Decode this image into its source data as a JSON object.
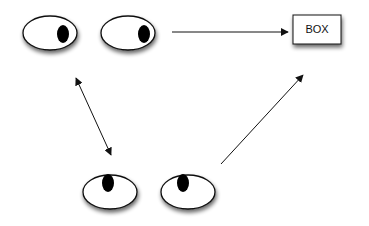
{
  "diagram": {
    "title": "",
    "colors": {
      "stroke": "#111111",
      "fill": "#ffffff",
      "pupil": "#000000",
      "shadow": "#555555"
    },
    "eyes": [
      {
        "id": "eye-top-left",
        "cx": 50,
        "cy": 33,
        "rx": 27,
        "ry": 17,
        "pupil": {
          "cx": 63,
          "cy": 34,
          "rx": 6,
          "ry": 9
        },
        "gaze": "right"
      },
      {
        "id": "eye-top-right",
        "cx": 128,
        "cy": 33,
        "rx": 27,
        "ry": 17,
        "pupil": {
          "cx": 144,
          "cy": 34,
          "rx": 6,
          "ry": 9
        },
        "gaze": "right"
      },
      {
        "id": "eye-bottom-left",
        "cx": 110,
        "cy": 192,
        "rx": 27,
        "ry": 17,
        "pupil": {
          "cx": 108,
          "cy": 183,
          "rx": 6,
          "ry": 9
        },
        "gaze": "up"
      },
      {
        "id": "eye-bottom-right",
        "cx": 188,
        "cy": 192,
        "rx": 27,
        "ry": 17,
        "pupil": {
          "cx": 183,
          "cy": 183,
          "rx": 6,
          "ry": 9
        },
        "gaze": "up"
      }
    ],
    "box": {
      "label": "BOX",
      "x": 293,
      "y": 15,
      "width": 48,
      "height": 29
    },
    "arrows": [
      {
        "id": "arrow-top-eyes-to-box",
        "x1": 172,
        "y1": 32,
        "x2": 288,
        "y2": 32,
        "heads": "end"
      },
      {
        "id": "arrow-top-bottom-eyes",
        "x1": 76,
        "y1": 78,
        "x2": 111,
        "y2": 155,
        "heads": "both"
      },
      {
        "id": "arrow-bottom-eyes-to-box",
        "x1": 221,
        "y1": 164,
        "x2": 303,
        "y2": 75,
        "heads": "end"
      }
    ]
  }
}
